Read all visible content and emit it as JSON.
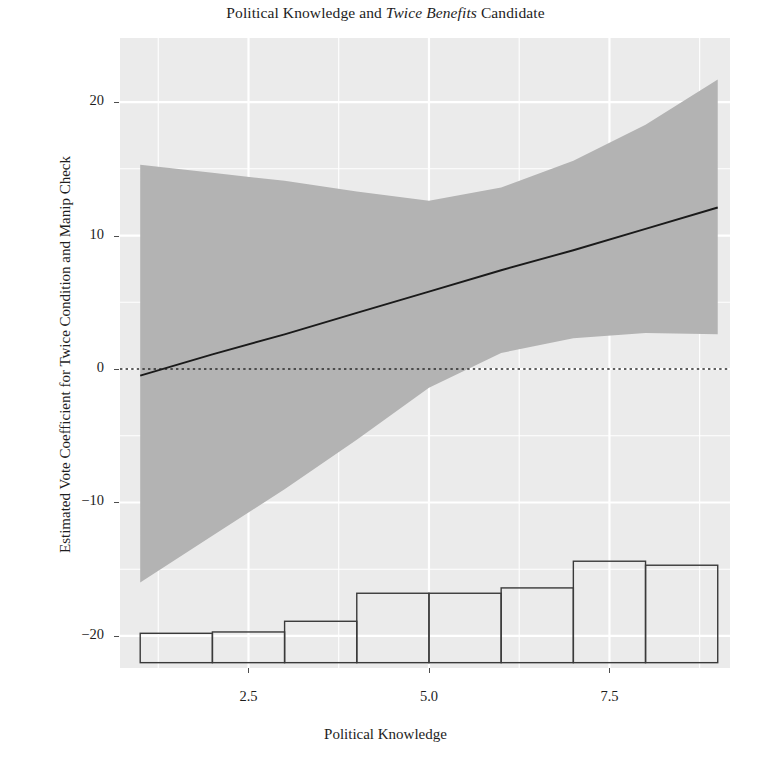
{
  "chart_data": {
    "type": "line",
    "title": "Political Knowledge and Twice Benefits Candidate",
    "title_plain": "Political Knowledge and ",
    "title_italic": "Twice Benefits",
    "title_tail": " Candidate",
    "xlabel": "Political Knowledge",
    "ylabel": "Estimated Vote Coefficient for Twice Condition and Manip Check",
    "xlim": [
      0.72,
      9.17
    ],
    "ylim": [
      -22.4,
      24.8
    ],
    "grid": true,
    "legend": "none",
    "panel_background": "#ebebeb",
    "grid_color": "#ffffff",
    "band_color": "#b3b3b3",
    "line_color": "#1a1a1a",
    "reference_line": {
      "y": 0,
      "style": "dotted",
      "color": "#2b2b2b"
    },
    "xticks": [
      2.5,
      5.0,
      7.5
    ],
    "xtick_labels": [
      "2.5",
      "5.0",
      "7.5"
    ],
    "yticks": [
      20,
      10,
      0,
      -10,
      -20
    ],
    "ytick_labels": [
      "20",
      "10",
      "0",
      "−10",
      "−20"
    ],
    "series": [
      {
        "name": "Marginal effect (fit)",
        "x": [
          1,
          2,
          3,
          4,
          5,
          6,
          7,
          8,
          9
        ],
        "values": [
          -0.5,
          1.1,
          2.6,
          4.2,
          5.8,
          7.4,
          8.9,
          10.5,
          12.1
        ]
      },
      {
        "name": "95% confidence band upper",
        "x": [
          1,
          2,
          3,
          4,
          5,
          6,
          7,
          8,
          9
        ],
        "values": [
          15.3,
          14.7,
          14.1,
          13.3,
          12.6,
          13.6,
          15.6,
          18.3,
          21.7
        ]
      },
      {
        "name": "95% confidence band lower",
        "x": [
          1,
          2,
          3,
          4,
          5,
          6,
          7,
          8,
          9
        ],
        "values": [
          -16.0,
          -12.5,
          -9.0,
          -5.3,
          -1.4,
          1.2,
          2.3,
          2.7,
          2.6
        ]
      }
    ],
    "histogram": {
      "name": "Distribution of Political Knowledge",
      "baseline_y": -22.0,
      "bin_edges": [
        1.0,
        2.0,
        3.0,
        4.0,
        5.0,
        6.0,
        7.0,
        8.0,
        9.0
      ],
      "bin_tops": [
        -19.8,
        -19.7,
        -18.9,
        -16.8,
        -16.8,
        -16.4,
        -14.4,
        -14.7
      ],
      "outline_color": "#3a3a3a",
      "fill": "none"
    }
  }
}
